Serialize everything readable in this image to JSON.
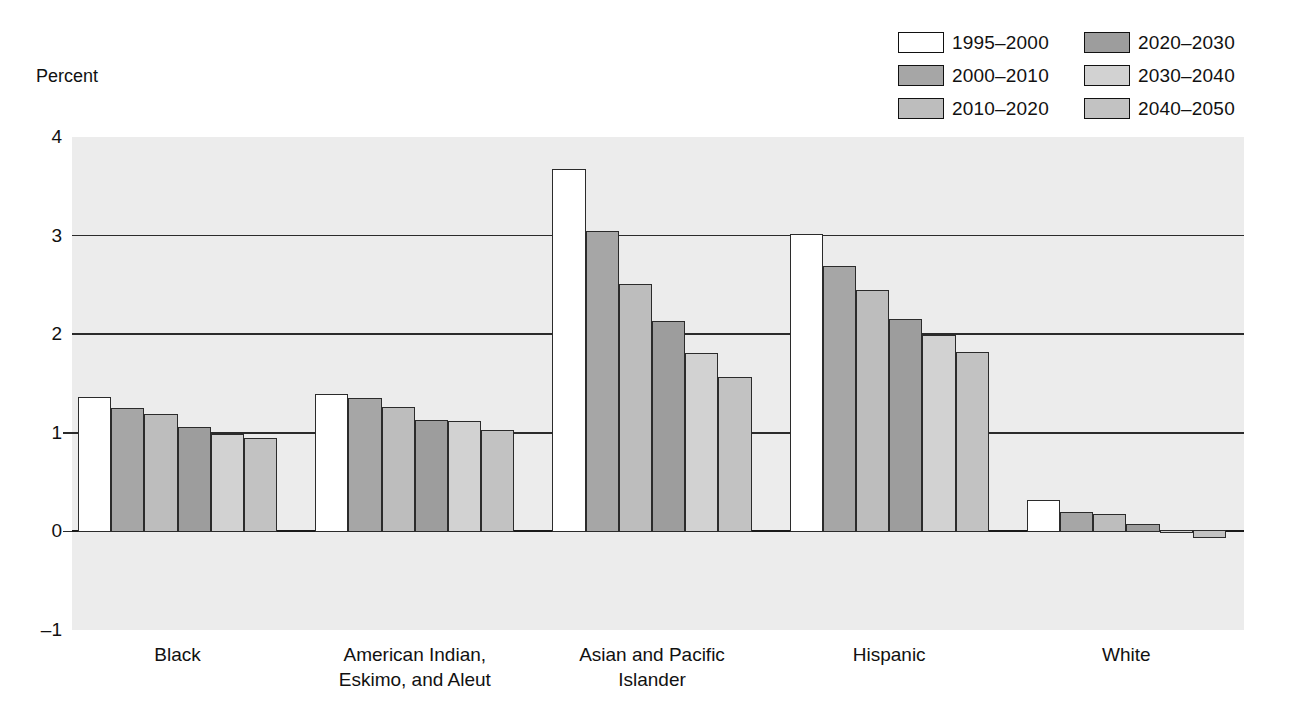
{
  "chart_data": {
    "type": "bar",
    "title": "",
    "xlabel": "",
    "ylabel": "Percent",
    "ylim": [
      -1,
      4
    ],
    "yticks": [
      -1,
      0,
      1,
      2,
      3,
      4
    ],
    "ytick_labels": [
      "–1",
      "0",
      "1",
      "2",
      "3",
      "4"
    ],
    "grid": true,
    "gridlines_at": [
      1,
      2,
      3
    ],
    "legend_position": "top-right",
    "categories": [
      "Black",
      "American Indian,\nEskimo, and Aleut",
      "Asian and Pacific\nIslander",
      "Hispanic",
      "White"
    ],
    "series": [
      {
        "name": "1995–2000",
        "color": "#ffffff",
        "values": [
          1.36,
          1.39,
          3.68,
          3.02,
          0.32
        ]
      },
      {
        "name": "2000–2010",
        "color": "#a6a6a6",
        "values": [
          1.25,
          1.35,
          3.05,
          2.69,
          0.2
        ]
      },
      {
        "name": "2010–2020",
        "color": "#bdbdbd",
        "values": [
          1.19,
          1.26,
          2.51,
          2.45,
          0.18
        ]
      },
      {
        "name": "2020–2030",
        "color": "#9d9d9d",
        "values": [
          1.06,
          1.13,
          2.13,
          2.15,
          0.08
        ]
      },
      {
        "name": "2030–2040",
        "color": "#d2d2d2",
        "values": [
          0.99,
          1.12,
          1.81,
          1.99,
          -0.02
        ]
      },
      {
        "name": "2040–2050",
        "color": "#c2c2c2",
        "values": [
          0.95,
          1.03,
          1.57,
          1.82,
          -0.07
        ]
      }
    ]
  },
  "legend": {
    "items": [
      {
        "label": "1995–2000",
        "color": "#ffffff"
      },
      {
        "label": "2020–2030",
        "color": "#9d9d9d"
      },
      {
        "label": "2000–2010",
        "color": "#a6a6a6"
      },
      {
        "label": "2030–2040",
        "color": "#d2d2d2"
      },
      {
        "label": "2010–2020",
        "color": "#bdbdbd"
      },
      {
        "label": "2040–2050",
        "color": "#c2c2c2"
      }
    ]
  },
  "axis": {
    "y_axis_label": "Percent"
  },
  "colors": {
    "plot_background": "#ececec",
    "page_background": "#ffffff",
    "axis_line": "#2b2b2b",
    "text": "#111111"
  }
}
